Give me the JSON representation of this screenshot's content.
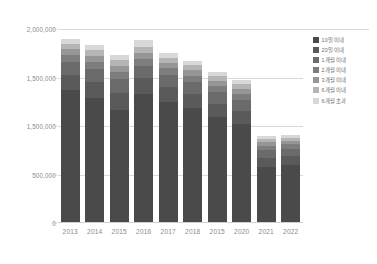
{
  "chart_data": {
    "type": "bar",
    "stacked": true,
    "orientation": "vertical",
    "title": "",
    "subtitle": "",
    "xlabel": "",
    "ylabel": "",
    "ylim": [
      0,
      2000000
    ],
    "grid": true,
    "legend_position": "right",
    "categories": [
      "2013",
      "2014",
      "2015",
      "2016",
      "2017",
      "2018",
      "2015",
      "2020",
      "2021",
      "2022"
    ],
    "ytick_labels": [
      "2,000,000",
      "1,500,000",
      "1,500,000",
      "500,000",
      "0"
    ],
    "ytick_values": [
      2000000,
      1500000,
      1000000,
      500000,
      0
    ],
    "series": [
      {
        "name": "10일 이내",
        "color": "#4a4a4a",
        "values": [
          1370000,
          1290000,
          1170000,
          1330000,
          1250000,
          1185000,
          1090000,
          1020000,
          580000,
          600000
        ]
      },
      {
        "name": "20일 이내",
        "color": "#5a5a5a",
        "values": [
          160000,
          165000,
          170000,
          160000,
          150000,
          145000,
          140000,
          135000,
          95000,
          92000
        ]
      },
      {
        "name": "1개월 이내",
        "color": "#6b6b6b",
        "values": [
          130000,
          135000,
          140000,
          132000,
          125000,
          120000,
          118000,
          115000,
          78000,
          76000
        ]
      },
      {
        "name": "2개월 이내",
        "color": "#7d7d7d",
        "values": [
          72000,
          74000,
          76000,
          73000,
          70000,
          68000,
          66000,
          64000,
          44000,
          43000
        ]
      },
      {
        "name": "3개월 이내",
        "color": "#969696",
        "values": [
          60000,
          62000,
          64000,
          61000,
          58000,
          56000,
          54000,
          52000,
          36000,
          35000
        ]
      },
      {
        "name": "6개월 이내",
        "color": "#b5b5b5",
        "values": [
          55000,
          57000,
          58000,
          56000,
          53000,
          51000,
          49000,
          47000,
          33000,
          32000
        ]
      },
      {
        "name": "6개월 초과",
        "color": "#d8d8d8",
        "values": [
          48000,
          52000,
          50000,
          78000,
          45000,
          43000,
          41000,
          40000,
          28000,
          27000
        ]
      }
    ]
  },
  "axis": {
    "ticks": [
      {
        "label": "2,000,000",
        "value": 2000000
      },
      {
        "label": "1,500,000",
        "value": 1500000
      },
      {
        "label": "1,500,000",
        "value": 1000000
      },
      {
        "label": "500,000",
        "value": 500000
      },
      {
        "label": "0",
        "value": 0
      }
    ]
  },
  "colors": {
    "grid": "#d9d9d9",
    "text": "#8a8a8a",
    "background": "#ffffff"
  }
}
